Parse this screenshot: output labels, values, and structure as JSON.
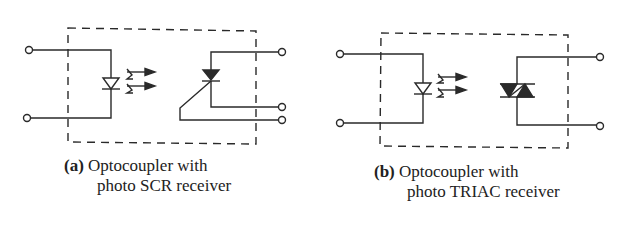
{
  "figures": [
    {
      "id": "a",
      "tag": "(a)",
      "caption_line1": "Optocoupler with",
      "caption_line2": "photo SCR receiver",
      "receiver_type": "SCR",
      "input_terminals": 2,
      "output_terminals": 3
    },
    {
      "id": "b",
      "tag": "(b)",
      "caption_line1": "Optocoupler with",
      "caption_line2": "photo TRIAC receiver",
      "receiver_type": "TRIAC",
      "input_terminals": 2,
      "output_terminals": 2
    }
  ],
  "colors": {
    "stroke": "#2a2a2a",
    "background": "#ffffff"
  }
}
